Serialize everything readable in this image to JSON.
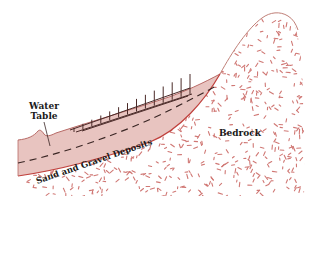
{
  "diagram": {
    "title": "",
    "labels": {
      "water_table_line1": "Water",
      "water_table_line2": "Table",
      "bedrock": "Bedrock",
      "deposits": "Sand and Gravel Deposits"
    },
    "colors": {
      "deposit_fill": "#e8c4c0",
      "deposit_outline": "#b86a66",
      "bedrock_speckle": "#c8605c",
      "outline_dark": "#4a2a28",
      "water_table_dash": "#3a2624",
      "background": "#ffffff"
    }
  }
}
